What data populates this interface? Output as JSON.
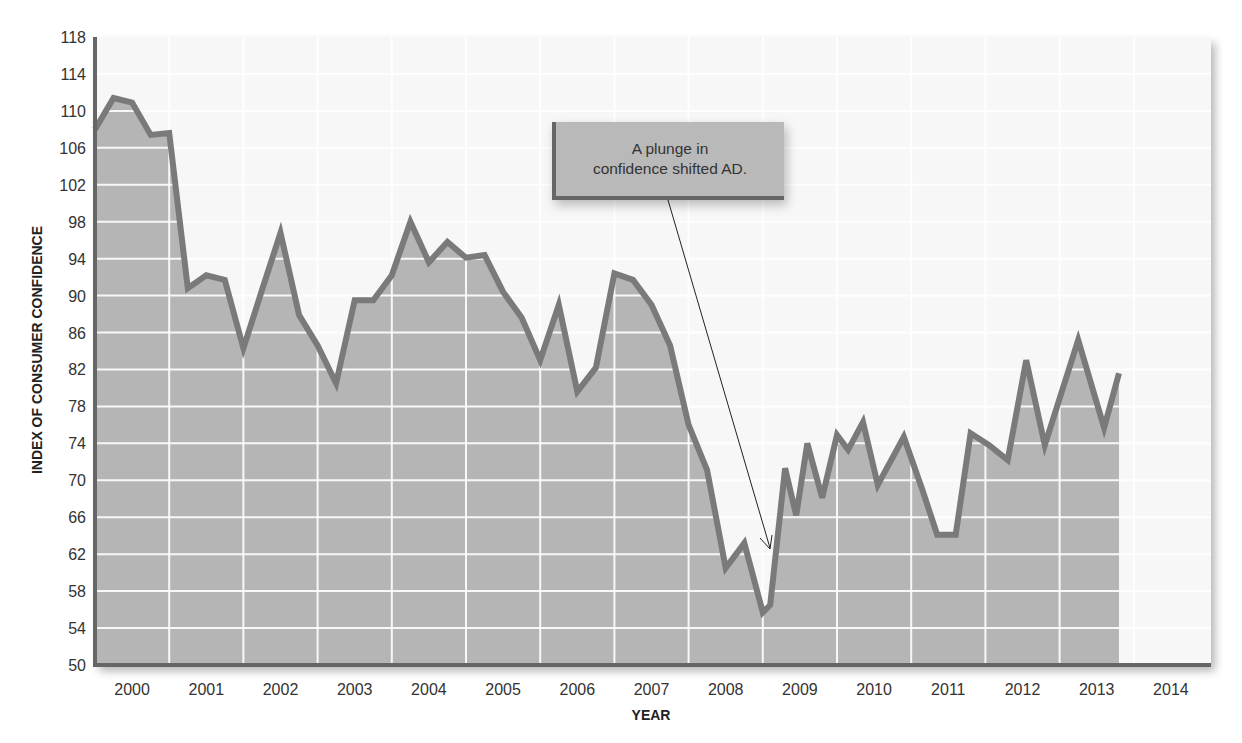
{
  "chart_data": {
    "type": "area",
    "title": "",
    "xlabel": "YEAR",
    "ylabel": "INDEX OF CONSUMER CONFIDENCE",
    "ylim": [
      50,
      118
    ],
    "yticks": [
      50,
      54,
      58,
      62,
      66,
      70,
      74,
      78,
      82,
      86,
      90,
      94,
      98,
      102,
      106,
      110,
      114,
      118
    ],
    "xticks": [
      "2000",
      "2001",
      "2002",
      "2003",
      "2004",
      "2005",
      "2006",
      "2007",
      "2008",
      "2009",
      "2010",
      "2011",
      "2012",
      "2013",
      "2014"
    ],
    "grid": true,
    "legend": null,
    "annotation": {
      "text_line1": "A plunge in",
      "text_line2": "confidence shifted AD.",
      "arrow_target": {
        "x": 2008.9,
        "y": 62
      }
    },
    "series": [
      {
        "name": "Index of Consumer Confidence",
        "x": [
          2000.0,
          2000.25,
          2000.5,
          2000.75,
          2001.0,
          2001.25,
          2001.5,
          2001.75,
          2002.0,
          2002.25,
          2002.5,
          2002.75,
          2003.0,
          2003.25,
          2003.5,
          2003.75,
          2004.0,
          2004.25,
          2004.5,
          2004.75,
          2005.0,
          2005.25,
          2005.5,
          2005.75,
          2006.0,
          2006.25,
          2006.5,
          2006.75,
          2007.0,
          2007.25,
          2007.5,
          2007.75,
          2008.0,
          2008.25,
          2008.5,
          2008.75,
          2009.0,
          2009.1,
          2009.3,
          2009.45,
          2009.6,
          2009.8,
          2010.0,
          2010.15,
          2010.35,
          2010.55,
          2010.9,
          2011.15,
          2011.35,
          2011.6,
          2011.8,
          2012.05,
          2012.3,
          2012.55,
          2012.8,
          2013.25,
          2013.6,
          2013.8
        ],
        "values": [
          108.0,
          111.4,
          110.9,
          107.4,
          107.6,
          90.8,
          92.2,
          91.7,
          84.3,
          90.6,
          96.8,
          87.9,
          84.6,
          80.5,
          89.5,
          89.5,
          92.2,
          98.0,
          93.6,
          95.8,
          94.1,
          94.4,
          90.4,
          87.6,
          83.0,
          89.0,
          79.6,
          82.2,
          92.4,
          91.7,
          89.0,
          84.6,
          76.0,
          71.1,
          60.5,
          63.2,
          55.7,
          56.5,
          71.3,
          66.2,
          74.0,
          68.1,
          74.9,
          73.3,
          76.3,
          69.5,
          74.7,
          69.0,
          64.1,
          64.1,
          75.1,
          73.8,
          72.2,
          83.0,
          73.8,
          85.2,
          75.7,
          81.6
        ]
      }
    ]
  },
  "colors": {
    "area_fill": "#b5b5b5",
    "line": "#7a7a7a",
    "grid_line": "#ffffff",
    "axis": "#666666",
    "bg_plot": "#f7f7f7",
    "text": "#333333"
  },
  "labels": {
    "xlabel": "YEAR",
    "ylabel": "INDEX OF CONSUMER CONFIDENCE",
    "callout_line1": "A plunge in",
    "callout_line2": "confidence shifted AD."
  }
}
